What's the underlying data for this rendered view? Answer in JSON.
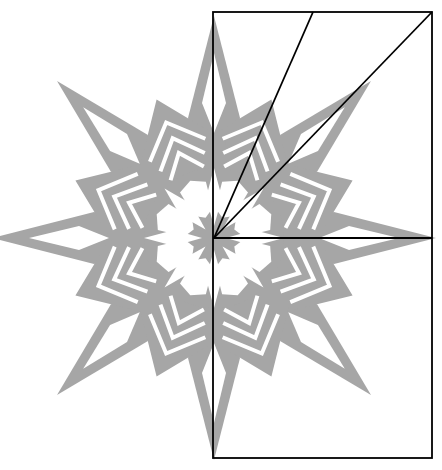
{
  "diagram": {
    "type": "paper snowflake cutting template",
    "colors": {
      "background": "#ffffff",
      "snowflake": "#a6a6a6",
      "fold_lines": "#000000"
    },
    "snowflake": {
      "center": [
        214,
        238
      ],
      "points": 8,
      "outer_radius": 222
    },
    "fold_guide": {
      "rect": {
        "x": 213,
        "y": 12,
        "width": 219,
        "height": 446
      },
      "horizontal_line_y": 238,
      "diagonals": [
        {
          "from": [
            214,
            238
          ],
          "to": [
            313,
            12
          ]
        },
        {
          "from": [
            214,
            238
          ],
          "to": [
            432,
            12
          ]
        }
      ]
    }
  }
}
